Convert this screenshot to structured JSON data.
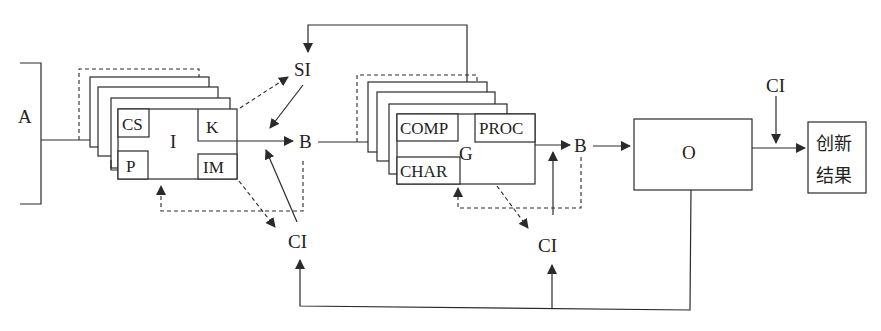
{
  "diagram": {
    "input": {
      "label": "A"
    },
    "block1": {
      "center_label": "I",
      "cells": {
        "top_left": "CS",
        "bottom_left": "P",
        "top_right": "K",
        "bottom_right": "IM"
      }
    },
    "block2": {
      "center_label": "G",
      "cells": {
        "top_left": "COMP",
        "bottom_left": "CHAR",
        "top_right": "PROC"
      }
    },
    "nodes": {
      "si": "SI",
      "b1": "B",
      "ci1": "CI",
      "b2": "B",
      "ci2": "CI",
      "ci3": "CI"
    },
    "output_box": {
      "label": "O"
    },
    "result_box": {
      "line1": "创新",
      "line2": "结果"
    },
    "colors": {
      "line": "#2a2a2a",
      "background": "#ffffff"
    }
  }
}
